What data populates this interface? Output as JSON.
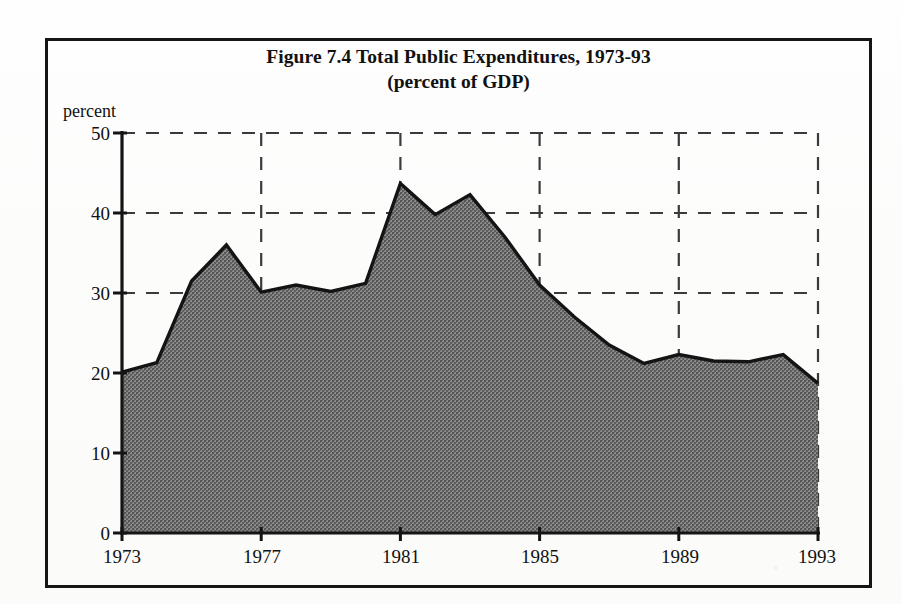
{
  "figure": {
    "title": "Figure 7.4 Total Public Expenditures, 1973-93",
    "subtitle": "(percent of GDP)",
    "y_axis_caption": "percent"
  },
  "axis": {
    "y_ticks": [
      "0",
      "10",
      "20",
      "30",
      "40",
      "50"
    ],
    "x_ticks": [
      "1973",
      "1977",
      "1981",
      "1985",
      "1989",
      "1993"
    ]
  },
  "colors": {
    "ink": "#151515",
    "area_fill": "#7a7a7a",
    "page": "#fdfdfc",
    "gridline": "#3a3a3a"
  },
  "chart_data": {
    "type": "area",
    "title": "Figure 7.4 Total Public Expenditures, 1973-93",
    "subtitle": "(percent of GDP)",
    "xlabel": "",
    "ylabel": "percent",
    "ylim": [
      0,
      50
    ],
    "xlim": [
      1973,
      1993
    ],
    "ytick_values": [
      0,
      10,
      20,
      30,
      40,
      50
    ],
    "xtick_values": [
      1973,
      1977,
      1981,
      1985,
      1989,
      1993
    ],
    "grid": "dashed horizontal gridlines at 20, 30, 40, 50 and dashed vertical gridlines at 1977, 1981, 1985, 1989, 1993",
    "legend": null,
    "x": [
      1973,
      1974,
      1975,
      1976,
      1977,
      1978,
      1979,
      1980,
      1981,
      1982,
      1983,
      1984,
      1985,
      1986,
      1987,
      1988,
      1989,
      1990,
      1991,
      1992,
      1993
    ],
    "values": [
      20.1,
      21.3,
      31.5,
      36.0,
      30.1,
      31.0,
      30.2,
      31.2,
      43.7,
      39.8,
      42.3,
      37.0,
      31.0,
      27.0,
      23.5,
      21.2,
      22.3,
      21.5,
      21.4,
      22.3,
      18.7
    ],
    "series": [
      {
        "name": "Total public expenditures (percent of GDP)",
        "values": [
          20.1,
          21.3,
          31.5,
          36.0,
          30.1,
          31.0,
          30.2,
          31.2,
          43.7,
          39.8,
          42.3,
          37.0,
          31.0,
          27.0,
          23.5,
          21.2,
          22.3,
          21.5,
          21.4,
          22.3,
          18.7
        ]
      }
    ]
  }
}
